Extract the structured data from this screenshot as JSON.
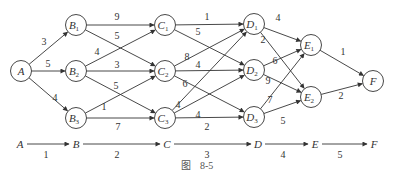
{
  "figure": {
    "caption_prefix": "图",
    "caption_number": "8-5"
  },
  "nodes": [
    {
      "id": "A",
      "label": "A",
      "sub": "",
      "x": 21,
      "y": 71
    },
    {
      "id": "B1",
      "label": "B",
      "sub": "1",
      "x": 76,
      "y": 25
    },
    {
      "id": "B2",
      "label": "B",
      "sub": "2",
      "x": 76,
      "y": 71
    },
    {
      "id": "B3",
      "label": "B",
      "sub": "3",
      "x": 76,
      "y": 118
    },
    {
      "id": "C1",
      "label": "C",
      "sub": "1",
      "x": 165,
      "y": 25
    },
    {
      "id": "C2",
      "label": "C",
      "sub": "2",
      "x": 165,
      "y": 71
    },
    {
      "id": "C3",
      "label": "C",
      "sub": "3",
      "x": 165,
      "y": 118
    },
    {
      "id": "D1",
      "label": "D",
      "sub": "1",
      "x": 254,
      "y": 24
    },
    {
      "id": "D2",
      "label": "D",
      "sub": "2",
      "x": 254,
      "y": 70
    },
    {
      "id": "D3",
      "label": "D",
      "sub": "3",
      "x": 254,
      "y": 117
    },
    {
      "id": "E1",
      "label": "E",
      "sub": "1",
      "x": 311,
      "y": 45
    },
    {
      "id": "E2",
      "label": "E",
      "sub": "2",
      "x": 311,
      "y": 97
    },
    {
      "id": "F",
      "label": "F",
      "sub": "",
      "x": 373,
      "y": 81
    }
  ],
  "edges": [
    {
      "from": "A",
      "to": "B1",
      "weight": "3",
      "lx": 44,
      "ly": 45
    },
    {
      "from": "A",
      "to": "B2",
      "weight": "5",
      "lx": 48,
      "ly": 67
    },
    {
      "from": "A",
      "to": "B3",
      "weight": "4",
      "lx": 55,
      "ly": 101
    },
    {
      "from": "B1",
      "to": "C1",
      "weight": "9",
      "lx": 117,
      "ly": 20
    },
    {
      "from": "B1",
      "to": "C2",
      "weight": "5",
      "lx": 117,
      "ly": 39
    },
    {
      "from": "B2",
      "to": "C1",
      "weight": "4",
      "lx": 97,
      "ly": 55
    },
    {
      "from": "B2",
      "to": "C2",
      "weight": "3",
      "lx": 117,
      "ly": 68
    },
    {
      "from": "B2",
      "to": "C3",
      "weight": "5",
      "lx": 116,
      "ly": 89
    },
    {
      "from": "B3",
      "to": "C2",
      "weight": "1",
      "lx": 104,
      "ly": 110
    },
    {
      "from": "B3",
      "to": "C3",
      "weight": "7",
      "lx": 118,
      "ly": 130
    },
    {
      "from": "C1",
      "to": "D1",
      "weight": "1",
      "lx": 207,
      "ly": 20
    },
    {
      "from": "C1",
      "to": "D2",
      "weight": "5",
      "lx": 198,
      "ly": 35
    },
    {
      "from": "C2",
      "to": "D1",
      "weight": "8",
      "lx": 187,
      "ly": 60
    },
    {
      "from": "C2",
      "to": "D2",
      "weight": "4",
      "lx": 198,
      "ly": 68
    },
    {
      "from": "C2",
      "to": "D3",
      "weight": "6",
      "lx": 185,
      "ly": 87
    },
    {
      "from": "C3",
      "to": "D1",
      "weight": "4",
      "lx": 178,
      "ly": 108
    },
    {
      "from": "C3",
      "to": "D2",
      "weight": "4",
      "lx": 198,
      "ly": 118
    },
    {
      "from": "C3",
      "to": "D3",
      "weight": "2",
      "lx": 207,
      "ly": 130
    },
    {
      "from": "D1",
      "to": "E1",
      "weight": "4",
      "lx": 278,
      "ly": 21
    },
    {
      "from": "D1",
      "to": "E2",
      "weight": "2",
      "lx": 263,
      "ly": 43
    },
    {
      "from": "D2",
      "to": "E1",
      "weight": "6",
      "lx": 275,
      "ly": 64
    },
    {
      "from": "D2",
      "to": "E2",
      "weight": "9",
      "lx": 268,
      "ly": 84
    },
    {
      "from": "D3",
      "to": "E1",
      "weight": "7",
      "lx": 270,
      "ly": 103
    },
    {
      "from": "D3",
      "to": "E2",
      "weight": "5",
      "lx": 283,
      "ly": 124
    },
    {
      "from": "E1",
      "to": "F",
      "weight": "1",
      "lx": 343,
      "ly": 55
    },
    {
      "from": "E2",
      "to": "F",
      "weight": "2",
      "lx": 341,
      "ly": 99
    }
  ],
  "stage_line": {
    "y": 144,
    "stages": [
      {
        "label": "A",
        "x": 20
      },
      {
        "label": "B",
        "x": 76
      },
      {
        "label": "C",
        "x": 167
      },
      {
        "label": "D",
        "x": 258
      },
      {
        "label": "E",
        "x": 315
      },
      {
        "label": "F",
        "x": 374
      }
    ],
    "steps": [
      {
        "label": "1",
        "x": 46
      },
      {
        "label": "2",
        "x": 117
      },
      {
        "label": "3",
        "x": 207
      },
      {
        "label": "4",
        "x": 283
      },
      {
        "label": "5",
        "x": 340
      }
    ]
  },
  "style": {
    "stroke": "#333333",
    "node_fill": "#ffffff",
    "node_radius": 10.5
  }
}
